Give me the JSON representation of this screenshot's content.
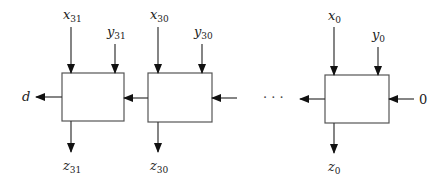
{
  "diagram": {
    "type": "ripple-chain-cells",
    "cells": [
      {
        "id": "cell-31",
        "x_label": {
          "base": "x",
          "sub": "31"
        },
        "y_label": {
          "base": "y",
          "sub": "31"
        },
        "z_label": {
          "base": "z",
          "sub": "31"
        }
      },
      {
        "id": "cell-30",
        "x_label": {
          "base": "x",
          "sub": "30"
        },
        "y_label": {
          "base": "y",
          "sub": "30"
        },
        "z_label": {
          "base": "z",
          "sub": "30"
        }
      },
      {
        "id": "cell-0",
        "x_label": {
          "base": "x",
          "sub": "0"
        },
        "y_label": {
          "base": "y",
          "sub": "0"
        },
        "z_label": {
          "base": "z",
          "sub": "0"
        }
      }
    ],
    "left_output_label": "d",
    "right_input_label": "0",
    "ellipsis": "· · ·"
  },
  "colors": {
    "line": "#333333",
    "box_border": "#555555",
    "text": "#222222"
  }
}
